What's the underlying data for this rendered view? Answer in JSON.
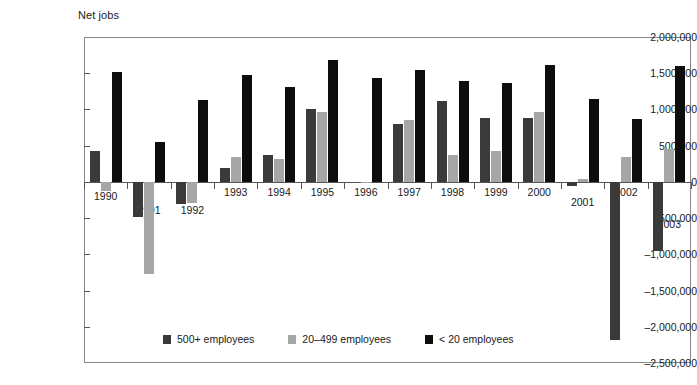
{
  "chart_data": {
    "type": "bar",
    "title": "",
    "ylabel": "Net jobs",
    "xlabel": "",
    "ylim": [
      -2500000,
      2000000
    ],
    "ytick_values": [
      2000000,
      1500000,
      1000000,
      500000,
      0,
      -500000,
      -1000000,
      -1500000,
      -2000000,
      -2500000
    ],
    "ytick_labels": [
      "2,000,000",
      "1,500,000",
      "1,000,000",
      "500,000",
      "0",
      "–500,000",
      "–1,000,000",
      "–1,500,000",
      "–2,000,000",
      "–2,500,000"
    ],
    "categories": [
      "1990",
      "1991",
      "1992",
      "1993",
      "1994",
      "1995",
      "1996",
      "1997",
      "1998",
      "1999",
      "2000",
      "2001",
      "2002",
      "2003"
    ],
    "grid": false,
    "legend_position": "bottom-inside",
    "series": [
      {
        "name": "500+ employees",
        "color": "#3a3a3a",
        "values": [
          430000,
          -480000,
          -310000,
          185000,
          375000,
          1005000,
          0,
          805000,
          1110000,
          880000,
          885000,
          -60000,
          -2180000,
          -950000
        ]
      },
      {
        "name": "20–499 employees",
        "color": "#a6a6a6",
        "values": [
          -125000,
          -1265000,
          -295000,
          340000,
          320000,
          960000,
          -15000,
          855000,
          375000,
          420000,
          960000,
          40000,
          340000,
          455000
        ]
      },
      {
        "name": "< 20 employees",
        "color": "#0d0d0d",
        "values": [
          1520000,
          550000,
          1130000,
          1480000,
          1305000,
          1685000,
          1440000,
          1550000,
          1390000,
          1370000,
          1615000,
          1145000,
          865000,
          1600000
        ]
      }
    ]
  },
  "footer": {
    "caption": ""
  }
}
